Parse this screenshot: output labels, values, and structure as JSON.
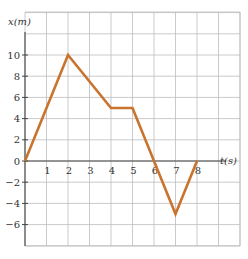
{
  "chart_data": {
    "type": "line",
    "title": "",
    "xlabel": "t(s)",
    "ylabel": "x(m)",
    "x": [
      0,
      2,
      4,
      5,
      6,
      7,
      8
    ],
    "series": [
      {
        "name": "x(t)",
        "values": [
          0,
          10,
          5,
          5,
          0,
          -5,
          0
        ],
        "color": "#c8742e"
      }
    ],
    "x_ticks": [
      "1",
      "2",
      "3",
      "4",
      "5",
      "6",
      "7",
      "8"
    ],
    "y_ticks": [
      "10",
      "8",
      "6",
      "4",
      "2",
      "0",
      "-2",
      "-4",
      "-6"
    ],
    "xlim": [
      0,
      10.3
    ],
    "ylim": [
      -8,
      14
    ],
    "grid": true
  },
  "labels": {
    "y_axis": "x(m)",
    "x_axis": "t(s)"
  }
}
